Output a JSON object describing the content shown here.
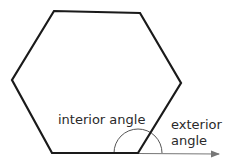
{
  "diagram": {
    "shape": "hexagon",
    "vertices": [
      [
        54,
        11
      ],
      [
        140,
        13
      ],
      [
        181,
        83
      ],
      [
        138,
        153
      ],
      [
        52,
        153
      ],
      [
        12,
        80
      ]
    ],
    "labels": {
      "interior": "interior angle",
      "exterior_line1": "exterior",
      "exterior_line2": "angle"
    },
    "colors": {
      "outline": "#1a1a1a",
      "arc": "#555555",
      "arrow": "#777777",
      "text": "#2a2a2a"
    }
  }
}
